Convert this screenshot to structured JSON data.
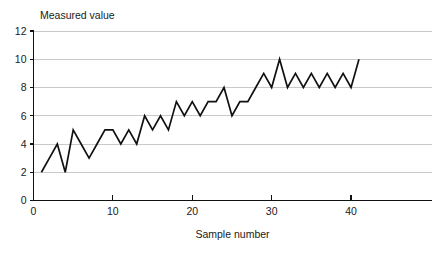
{
  "chart_data": {
    "type": "line",
    "title": "",
    "xlabel": "Sample number",
    "ylabel": "Measured value",
    "ylabel_position": "top-left",
    "xlim": [
      0,
      50.2
    ],
    "ylim": [
      0,
      12
    ],
    "ytick_values": [
      0,
      2,
      4,
      6,
      8,
      10,
      12
    ],
    "ytick_labels": [
      "0",
      "2",
      "4",
      "6",
      "8",
      "10",
      "12"
    ],
    "xtick_values": [
      0,
      10,
      20,
      30,
      40
    ],
    "xtick_labels": [
      "0",
      "10",
      "20",
      "30",
      "40"
    ],
    "grid": "horizontal",
    "legend": "none",
    "line_color": "#111111",
    "grid_color": "#c9c9c9",
    "axis_color": "#111111",
    "background_color": "#ffffff",
    "x": [
      1,
      2,
      3,
      4,
      5,
      6,
      7,
      8,
      9,
      10,
      11,
      12,
      13,
      14,
      15,
      16,
      17,
      18,
      19,
      20,
      21,
      22,
      23,
      24,
      25,
      26,
      27,
      28,
      29,
      30,
      31,
      32,
      33,
      34,
      35,
      36,
      37,
      38,
      39,
      40,
      41
    ],
    "values": [
      2,
      3,
      4,
      2,
      5,
      4,
      3,
      4,
      5,
      5,
      4,
      5,
      4,
      6,
      5,
      6,
      5,
      7,
      6,
      7,
      6,
      7,
      7,
      8,
      6,
      7,
      7,
      8,
      9,
      8,
      10,
      8,
      9,
      8,
      9,
      8,
      9,
      8,
      9,
      8,
      10
    ],
    "series": [
      {
        "name": "Measured value",
        "values": [
          2,
          3,
          4,
          2,
          5,
          4,
          3,
          4,
          5,
          5,
          4,
          5,
          4,
          6,
          5,
          6,
          5,
          7,
          6,
          7,
          6,
          7,
          7,
          8,
          6,
          7,
          7,
          8,
          9,
          8,
          10,
          8,
          9,
          8,
          9,
          8,
          9,
          8,
          9,
          8,
          10
        ]
      }
    ]
  },
  "labels": {
    "y_axis_title": "Measured value",
    "x_axis_title": "Sample number"
  }
}
